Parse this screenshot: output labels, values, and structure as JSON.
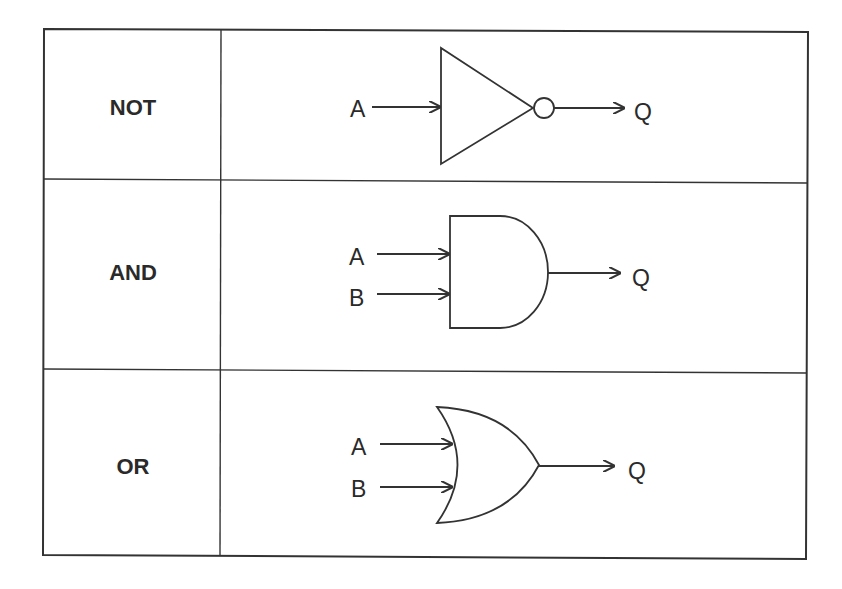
{
  "table": {
    "rows": [
      {
        "gate": "NOT",
        "inputs": [
          "A"
        ],
        "output": "Q"
      },
      {
        "gate": "AND",
        "inputs": [
          "A",
          "B"
        ],
        "output": "Q"
      },
      {
        "gate": "OR",
        "inputs": [
          "A",
          "B"
        ],
        "output": "Q"
      }
    ]
  },
  "colors": {
    "line": "#333333",
    "background": "#ffffff"
  }
}
